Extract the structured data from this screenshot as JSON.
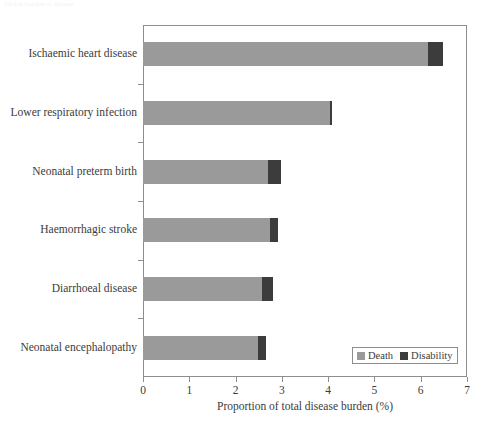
{
  "caption_sliver": "Global burden of disease",
  "chart_data": {
    "type": "bar",
    "orientation": "horizontal",
    "stacked": true,
    "title": "",
    "xlabel": "Proportion of total disease burden (%)",
    "ylabel": "",
    "xlim": [
      0,
      7
    ],
    "xticks": [
      "0",
      "1",
      "2",
      "3",
      "4",
      "5",
      "6",
      "7"
    ],
    "grid": false,
    "legend_position": "bottom-right",
    "categories": [
      "Ischaemic heart disease",
      "Lower respiratory infection",
      "Neonatal preterm birth",
      "Haemorrhagic stroke",
      "Diarrhoeal disease",
      "Neonatal encephalopathy"
    ],
    "series": [
      {
        "name": "Death",
        "color": "#9a9a9a",
        "values": [
          6.15,
          4.05,
          2.7,
          2.74,
          2.57,
          2.48
        ]
      },
      {
        "name": "Disability",
        "color": "#3c3c3c",
        "values": [
          0.33,
          0.03,
          0.28,
          0.18,
          0.24,
          0.18
        ]
      }
    ],
    "totals": [
      6.48,
      4.08,
      2.98,
      2.92,
      2.81,
      2.66
    ]
  },
  "legend": {
    "entries": [
      {
        "label": "Death"
      },
      {
        "label": "Disability"
      }
    ]
  },
  "colors": {
    "death": "#9a9a9a",
    "disability": "#3c3c3c",
    "axis": "#8d8d8f",
    "text": "#3b3b3b",
    "background": "#ffffff"
  }
}
